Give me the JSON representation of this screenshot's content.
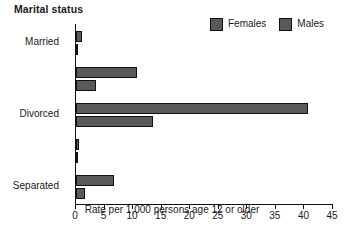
{
  "chart_data": {
    "type": "bar",
    "orientation": "horizontal",
    "title": "Marital status",
    "xlabel": "Rate per 1,000 persons age 12 or older",
    "ylabel": "",
    "xlim": [
      0,
      45
    ],
    "xticks": [
      0,
      5,
      10,
      15,
      20,
      25,
      30,
      35,
      40,
      45
    ],
    "xtick_labels": [
      "0",
      "5",
      "10",
      "15",
      "20",
      "25",
      "30",
      "35",
      "40",
      "45"
    ],
    "grid": false,
    "legend_position": "top-right",
    "categories": [
      "Married",
      "Divorced",
      "Separated",
      "Widowed",
      "Never married"
    ],
    "series": [
      {
        "name": "Females",
        "color": "#595959",
        "values": [
          1.0,
          10.6,
          40.7,
          0.6,
          6.6
        ]
      },
      {
        "name": "Males",
        "color": "#595959",
        "values": [
          0.3,
          3.5,
          13.4,
          0.2,
          1.5
        ]
      }
    ]
  },
  "legend": {
    "entries": [
      {
        "label": "Females",
        "swatch_color": "#595959"
      },
      {
        "label": "Males",
        "swatch_color": "#595959"
      }
    ]
  },
  "axis": {
    "x_title": "Rate per 1,000 persons age 12 or older"
  }
}
